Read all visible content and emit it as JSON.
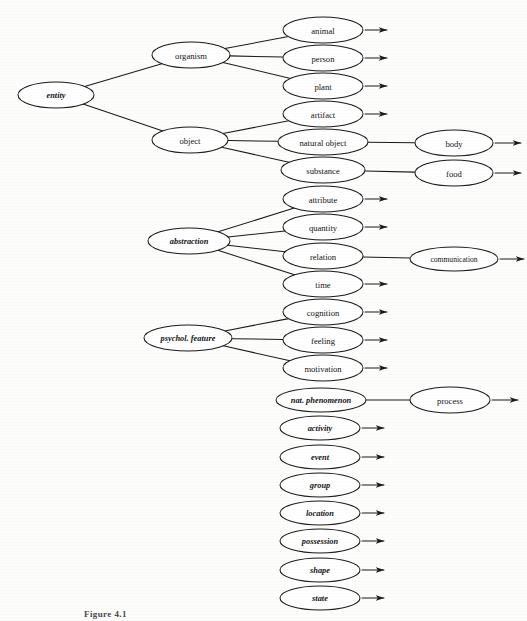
{
  "figure": {
    "caption": "Figure 4.1",
    "ink_color": "#1a1a1a",
    "page_color": "#fdfdfc"
  },
  "nodes": {
    "entity": {
      "label": "entity",
      "cx": 56,
      "cy": 95,
      "rx": 38,
      "ry": 13,
      "style": "ital"
    },
    "organism": {
      "label": "organism",
      "cx": 191,
      "cy": 55,
      "rx": 39,
      "ry": 13,
      "style": "plain"
    },
    "object": {
      "label": "object",
      "cx": 190,
      "cy": 140,
      "rx": 38,
      "ry": 13,
      "style": "plain"
    },
    "abstraction": {
      "label": "abstraction",
      "cx": 189,
      "cy": 241,
      "rx": 41,
      "ry": 13,
      "style": "ital"
    },
    "psychol_feature": {
      "label": "psychol. feature",
      "cx": 188,
      "cy": 338,
      "rx": 44,
      "ry": 13,
      "style": "ital"
    },
    "animal": {
      "label": "animal",
      "cx": 323,
      "cy": 30,
      "rx": 40,
      "ry": 13,
      "style": "plain"
    },
    "person": {
      "label": "person",
      "cx": 323,
      "cy": 58,
      "rx": 40,
      "ry": 13,
      "style": "plain"
    },
    "plant": {
      "label": "plant",
      "cx": 323,
      "cy": 86,
      "rx": 40,
      "ry": 13,
      "style": "plain"
    },
    "artifact": {
      "label": "artifact",
      "cx": 323,
      "cy": 114,
      "rx": 40,
      "ry": 13,
      "style": "plain"
    },
    "natural_object": {
      "label": "natural object",
      "cx": 323,
      "cy": 142,
      "rx": 45,
      "ry": 13,
      "style": "plain"
    },
    "substance": {
      "label": "substance",
      "cx": 323,
      "cy": 170,
      "rx": 42,
      "ry": 13,
      "style": "plain"
    },
    "attribute": {
      "label": "attribute",
      "cx": 323,
      "cy": 199,
      "rx": 40,
      "ry": 13,
      "style": "plain"
    },
    "quantity": {
      "label": "quantity",
      "cx": 323,
      "cy": 227,
      "rx": 40,
      "ry": 13,
      "style": "plain"
    },
    "relation": {
      "label": "relation",
      "cx": 323,
      "cy": 256,
      "rx": 40,
      "ry": 13,
      "style": "plain"
    },
    "time": {
      "label": "time",
      "cx": 323,
      "cy": 284,
      "rx": 40,
      "ry": 13,
      "style": "plain"
    },
    "cognition": {
      "label": "cognition",
      "cx": 323,
      "cy": 312,
      "rx": 40,
      "ry": 13,
      "style": "plain"
    },
    "feeling": {
      "label": "feeling",
      "cx": 323,
      "cy": 340,
      "rx": 40,
      "ry": 13,
      "style": "plain"
    },
    "motivation": {
      "label": "motivation",
      "cx": 323,
      "cy": 368,
      "rx": 40,
      "ry": 13,
      "style": "plain"
    },
    "nat_phenomenon": {
      "label": "nat. phenomenon",
      "cx": 321,
      "cy": 400,
      "rx": 45,
      "ry": 12,
      "style": "ital"
    },
    "activity": {
      "label": "activity",
      "cx": 320,
      "cy": 428,
      "rx": 40,
      "ry": 12,
      "style": "ital"
    },
    "event": {
      "label": "event",
      "cx": 320,
      "cy": 457,
      "rx": 40,
      "ry": 12,
      "style": "ital"
    },
    "group": {
      "label": "group",
      "cx": 320,
      "cy": 485,
      "rx": 40,
      "ry": 12,
      "style": "ital"
    },
    "location": {
      "label": "location",
      "cx": 320,
      "cy": 513,
      "rx": 40,
      "ry": 12,
      "style": "ital"
    },
    "possession": {
      "label": "possession",
      "cx": 320,
      "cy": 541,
      "rx": 40,
      "ry": 12,
      "style": "ital"
    },
    "shape": {
      "label": "shape",
      "cx": 320,
      "cy": 570,
      "rx": 40,
      "ry": 12,
      "style": "ital"
    },
    "state": {
      "label": "state",
      "cx": 320,
      "cy": 598,
      "rx": 40,
      "ry": 12,
      "style": "ital"
    },
    "body": {
      "label": "body",
      "cx": 454,
      "cy": 143,
      "rx": 39,
      "ry": 13,
      "style": "plain"
    },
    "food": {
      "label": "food",
      "cx": 454,
      "cy": 173,
      "rx": 39,
      "ry": 13,
      "style": "plain"
    },
    "communication": {
      "label": "communication",
      "cx": 454,
      "cy": 259,
      "rx": 44,
      "ry": 12,
      "style": "small"
    },
    "process": {
      "label": "process",
      "cx": 450,
      "cy": 400,
      "rx": 40,
      "ry": 13,
      "style": "plain"
    }
  },
  "edges": [
    {
      "from": "entity",
      "to": "organism"
    },
    {
      "from": "entity",
      "to": "object"
    },
    {
      "from": "organism",
      "to": "animal"
    },
    {
      "from": "organism",
      "to": "person"
    },
    {
      "from": "organism",
      "to": "plant"
    },
    {
      "from": "object",
      "to": "artifact"
    },
    {
      "from": "object",
      "to": "natural_object"
    },
    {
      "from": "object",
      "to": "substance"
    },
    {
      "from": "abstraction",
      "to": "attribute"
    },
    {
      "from": "abstraction",
      "to": "quantity"
    },
    {
      "from": "abstraction",
      "to": "relation"
    },
    {
      "from": "abstraction",
      "to": "time"
    },
    {
      "from": "psychol_feature",
      "to": "cognition"
    },
    {
      "from": "psychol_feature",
      "to": "feeling"
    },
    {
      "from": "psychol_feature",
      "to": "motivation"
    },
    {
      "from": "natural_object",
      "to": "body"
    },
    {
      "from": "substance",
      "to": "food"
    },
    {
      "from": "relation",
      "to": "communication"
    },
    {
      "from": "nat_phenomenon",
      "to": "process"
    }
  ],
  "open_arrows": [
    {
      "from": "animal",
      "len": 22
    },
    {
      "from": "person",
      "len": 22
    },
    {
      "from": "plant",
      "len": 22
    },
    {
      "from": "artifact",
      "len": 22
    },
    {
      "from": "attribute",
      "len": 22
    },
    {
      "from": "quantity",
      "len": 22
    },
    {
      "from": "time",
      "len": 22
    },
    {
      "from": "cognition",
      "len": 22
    },
    {
      "from": "feeling",
      "len": 22
    },
    {
      "from": "motivation",
      "len": 22
    },
    {
      "from": "activity",
      "len": 22
    },
    {
      "from": "event",
      "len": 22
    },
    {
      "from": "group",
      "len": 22
    },
    {
      "from": "location",
      "len": 22
    },
    {
      "from": "possession",
      "len": 22
    },
    {
      "from": "shape",
      "len": 22
    },
    {
      "from": "state",
      "len": 22
    },
    {
      "from": "body",
      "len": 26
    },
    {
      "from": "food",
      "len": 26
    },
    {
      "from": "communication",
      "len": 24
    },
    {
      "from": "process",
      "len": 26
    }
  ]
}
